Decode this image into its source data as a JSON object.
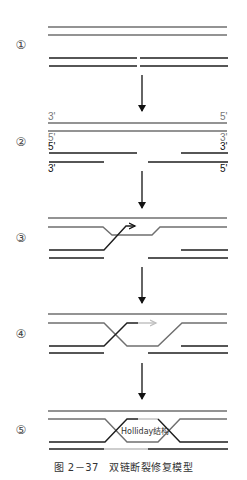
{
  "colors": {
    "gray_strand": "#6f6f6f",
    "dark_strand": "#1e1e1e",
    "new_synthesis": "#bdbdbd",
    "arrow": "#111111"
  },
  "stages": [
    {
      "number": "①"
    },
    {
      "number": "②"
    },
    {
      "number": "③"
    },
    {
      "number": "④"
    },
    {
      "number": "⑤"
    }
  ],
  "stage2_labels": {
    "top_left": "3'",
    "top_right": "5'",
    "second_left": "5'",
    "second_right": "3'",
    "third_left": "5'",
    "third_right": "3'",
    "bottom_left": "3'",
    "bottom_right": "5'"
  },
  "holliday_label": "Holliday结构",
  "caption": "图 2－37　双链断裂修复模型"
}
